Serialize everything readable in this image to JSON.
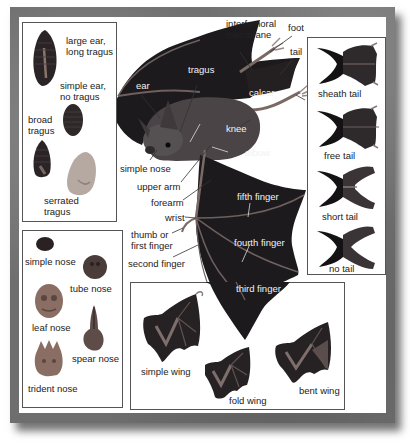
{
  "ears_panel": {
    "items": [
      {
        "label_line1": "large ear,",
        "label_line2": "long tragus"
      },
      {
        "label_line1": "simple ear,",
        "label_line2": "no tragus"
      },
      {
        "label_line1": "broad",
        "label_line2": "tragus"
      },
      {
        "label_line1": "serrated",
        "label_line2": "tragus"
      }
    ]
  },
  "nose_panel": {
    "items": [
      {
        "label": "simple nose"
      },
      {
        "label": "tube nose"
      },
      {
        "label": "leaf nose"
      },
      {
        "label": "spear nose"
      },
      {
        "label": "trident nose"
      }
    ]
  },
  "body_labels": {
    "interfemoral_line1": "interfemoral",
    "interfemoral_line2": "membrane",
    "foot": "foot",
    "tail": "tail",
    "tragus": "tragus",
    "ear": "ear",
    "calcar": "calcar",
    "knee": "knee",
    "simple_nose": "simple nose",
    "elbow": "elbow",
    "upper_arm": "upper arm",
    "forearm": "forearm",
    "fifth_finger": "fifth finger",
    "wrist": "wrist",
    "thumb_line1": "thumb or",
    "thumb_line2": "first finger",
    "fourth_finger": "fourth finger",
    "second_finger": "second finger",
    "third_finger": "third finger"
  },
  "tail_panel": {
    "items": [
      {
        "label": "sheath tail"
      },
      {
        "label": "free tail"
      },
      {
        "label": "short tail"
      },
      {
        "label": "no tail"
      }
    ]
  },
  "wing_panel": {
    "items": [
      {
        "label": "simple wing"
      },
      {
        "label": "fold wing"
      },
      {
        "label": "bent wing"
      }
    ]
  },
  "colors": {
    "frame": "#6e6e6e",
    "membrane": "#1c1a1c",
    "fur": "#4a4446",
    "wing_bone": "#8a7a78",
    "nose_skin": "#8a7068",
    "label_dark": "#222222",
    "label_light": "#f2f2f2"
  }
}
